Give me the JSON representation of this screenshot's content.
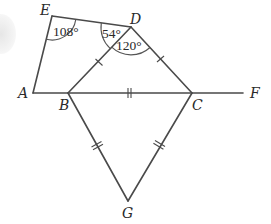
{
  "diagram": {
    "type": "geometry-figure",
    "points": {
      "E": {
        "label": "E",
        "x": 52,
        "y": 16
      },
      "D": {
        "label": "D",
        "x": 131,
        "y": 27
      },
      "A": {
        "label": "A",
        "x": 33,
        "y": 93
      },
      "B": {
        "label": "B",
        "x": 68,
        "y": 93
      },
      "C": {
        "label": "C",
        "x": 192,
        "y": 93
      },
      "F": {
        "label": "F",
        "x": 243,
        "y": 93
      },
      "G": {
        "label": "G",
        "x": 128,
        "y": 201
      }
    },
    "segments": [
      "AE",
      "ED",
      "DB",
      "DC",
      "AF",
      "BG",
      "CG"
    ],
    "angles": {
      "E": "108°",
      "EDB": "54°",
      "BDC": "120°"
    },
    "equal_marks": {
      "single_tick": [
        "DB",
        "DC"
      ],
      "double_tick": [
        "BC",
        "BG",
        "CG"
      ]
    },
    "colors": {
      "line": "#4a4a4a",
      "text": "#2a2a2a",
      "background": "#ffffff"
    }
  }
}
